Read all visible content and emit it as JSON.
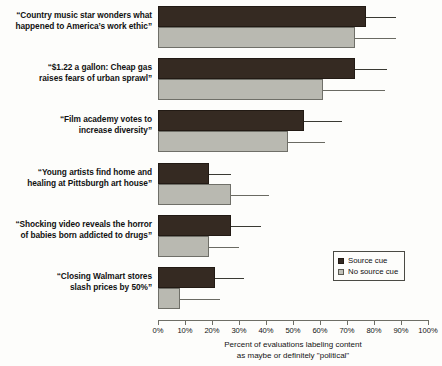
{
  "chart_data": {
    "type": "bar",
    "orientation": "horizontal",
    "title": "",
    "xlabel": "Percent of evaluations labeling content as maybe or definitely \"political\"",
    "xlabel_line1": "Percent of evaluations labeling content",
    "xlabel_line2": "as maybe or definitely \"political\"",
    "ylabel": "",
    "xlim": [
      0,
      100
    ],
    "xticks": [
      0,
      10,
      20,
      30,
      40,
      50,
      60,
      70,
      80,
      90,
      100
    ],
    "xtick_labels": [
      "0%",
      "10%",
      "20%",
      "30%",
      "40%",
      "50%",
      "60%",
      "70%",
      "80%",
      "90%",
      "100%"
    ],
    "grid": false,
    "legend_position": "right-lower",
    "categories": [
      "“Country music star wonders what happened to America’s work ethic”",
      "“$1.22 a gallon: Cheap gas raises fears of urban sprawl”",
      "“Film academy votes to increase diversity”",
      "“Young artists find home and healing at Pittsburgh art house”",
      "“Shocking video reveals the horror of babies born addicted to drugs”",
      "“Closing Walmart stores slash prices by 50%”"
    ],
    "category_lines": [
      [
        "“Country music star wonders what",
        "happened to America’s work ethic”"
      ],
      [
        "“$1.22 a gallon: Cheap gas",
        "raises fears of urban sprawl”"
      ],
      [
        "“Film academy votes to",
        "increase diversity”"
      ],
      [
        "“Young artists find home and",
        "healing at Pittsburgh art house”"
      ],
      [
        "“Shocking video reveals the horror",
        "of babies born addicted to drugs”"
      ],
      [
        "“Closing Walmart stores",
        "slash prices by 50%”"
      ]
    ],
    "series": [
      {
        "name": "Source cue",
        "color": "#352a22",
        "values": [
          77,
          73,
          54,
          19,
          27,
          21
        ],
        "error_high": [
          88,
          85,
          68,
          27,
          38,
          32
        ]
      },
      {
        "name": "No source cue",
        "color": "#b9b9b1",
        "values": [
          73,
          61,
          48,
          27,
          19,
          8
        ],
        "error_high": [
          88,
          84,
          62,
          41,
          30,
          23
        ]
      }
    ]
  },
  "legend": {
    "items": [
      {
        "label": "Source cue"
      },
      {
        "label": "No source cue"
      }
    ]
  }
}
